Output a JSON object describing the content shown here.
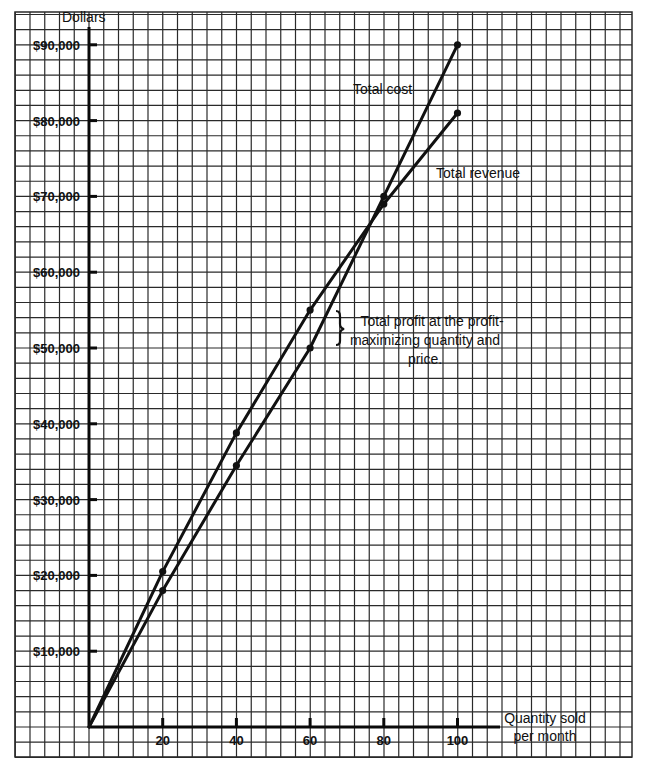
{
  "chart_data": {
    "type": "line",
    "title": "",
    "xlabel": "Quantity sold per month",
    "ylabel": "Dollars",
    "x": [
      0,
      20,
      40,
      60,
      80,
      100
    ],
    "xticks": [
      20,
      40,
      60,
      80,
      100
    ],
    "yticks": [
      10000,
      20000,
      30000,
      40000,
      50000,
      60000,
      70000,
      80000,
      90000
    ],
    "ytick_labels": [
      "$10,000",
      "$20,000",
      "$30,000",
      "$40,000",
      "$50,000",
      "$60,000",
      "$70,000",
      "$80,000",
      "$90,000"
    ],
    "xlim": [
      0,
      110
    ],
    "ylim": [
      0,
      90000
    ],
    "grid": true,
    "series": [
      {
        "name": "Total cost",
        "values": [
          0,
          18000,
          34500,
          50000,
          70000,
          90000
        ]
      },
      {
        "name": "Total revenue",
        "values": [
          0,
          20500,
          38800,
          55000,
          69000,
          81000
        ]
      }
    ],
    "annotations": [
      {
        "text": "Total profit at the profit-maximizing quantity and price.",
        "x": 60,
        "y_range": [
          50000,
          55000
        ]
      }
    ]
  },
  "labels": {
    "y_axis_title": "Dollars",
    "x_axis_title_line1": "Quantity sold",
    "x_axis_title_line2": "per month",
    "total_cost": "Total cost",
    "total_revenue": "Total revenue",
    "annotation_line1": "Total profit at the profit-",
    "annotation_line2": "maximizing quantity and",
    "annotation_line3": "price."
  }
}
